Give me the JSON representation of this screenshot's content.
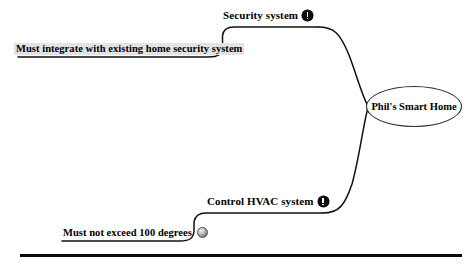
{
  "diagram": {
    "type": "mind-map",
    "title_node": "Phil's Smart Home",
    "background_color": "#ffffff",
    "line_color": "#111111",
    "highlight_color": "#e3e3e3",
    "branches": [
      {
        "id": "security",
        "label": "Security system",
        "marker": "exclamation-icon",
        "position": "upper",
        "leaf": {
          "label": "Must integrate with existing home security system",
          "marker": "none",
          "highlighted": true
        }
      },
      {
        "id": "hvac",
        "label": "Control HVAC system",
        "marker": "exclamation-icon",
        "position": "lower",
        "leaf": {
          "label": "Must not exceed 100 degrees",
          "marker": "sphere-icon",
          "highlighted": false
        }
      }
    ],
    "footer_rule": {
      "visible": true
    }
  }
}
